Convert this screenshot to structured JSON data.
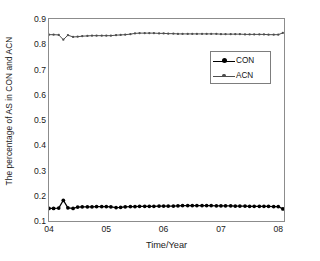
{
  "chart_data": {
    "type": "line",
    "title": "",
    "xlabel": "Time/Year",
    "ylabel": "The percentage of AS in CON and ACN",
    "xlim": [
      2004.0,
      2008.1
    ],
    "ylim": [
      0.1,
      0.9
    ],
    "xticks": [
      "04",
      "05",
      "06",
      "07",
      "08"
    ],
    "xtick_values": [
      2004,
      2005,
      2006,
      2007,
      2008
    ],
    "yticks": [
      "0.1",
      "0.2",
      "0.3",
      "0.4",
      "0.5",
      "0.6",
      "0.7",
      "0.8",
      "0.9"
    ],
    "ytick_values": [
      0.1,
      0.2,
      0.3,
      0.4,
      0.5,
      0.6,
      0.7,
      0.8,
      0.9
    ],
    "grid": false,
    "legend_position": "upper-right",
    "series": [
      {
        "name": "CON",
        "color": "#000000",
        "marker": "filled-circle",
        "x": [
          2004.0,
          2004.08,
          2004.17,
          2004.25,
          2004.33,
          2004.42,
          2004.5,
          2004.58,
          2004.67,
          2004.75,
          2004.83,
          2004.92,
          2005.0,
          2005.08,
          2005.17,
          2005.25,
          2005.33,
          2005.42,
          2005.5,
          2005.58,
          2005.67,
          2005.75,
          2005.83,
          2005.92,
          2006.0,
          2006.08,
          2006.17,
          2006.25,
          2006.33,
          2006.42,
          2006.5,
          2006.58,
          2006.67,
          2006.75,
          2006.83,
          2006.92,
          2007.0,
          2007.08,
          2007.17,
          2007.25,
          2007.33,
          2007.42,
          2007.5,
          2007.58,
          2007.67,
          2007.75,
          2007.83,
          2007.92,
          2008.0,
          2008.08
        ],
        "values": [
          0.15,
          0.15,
          0.151,
          0.182,
          0.152,
          0.15,
          0.155,
          0.156,
          0.156,
          0.156,
          0.157,
          0.157,
          0.157,
          0.156,
          0.153,
          0.154,
          0.156,
          0.157,
          0.157,
          0.158,
          0.158,
          0.158,
          0.158,
          0.159,
          0.159,
          0.159,
          0.159,
          0.16,
          0.161,
          0.161,
          0.161,
          0.161,
          0.161,
          0.161,
          0.161,
          0.16,
          0.16,
          0.16,
          0.16,
          0.159,
          0.159,
          0.159,
          0.158,
          0.158,
          0.158,
          0.158,
          0.158,
          0.157,
          0.157,
          0.148
        ]
      },
      {
        "name": "ACN",
        "color": "#4d4d4d",
        "marker": "small-dash",
        "x": [
          2004.0,
          2004.08,
          2004.17,
          2004.25,
          2004.33,
          2004.42,
          2004.5,
          2004.58,
          2004.67,
          2004.75,
          2004.83,
          2004.92,
          2005.0,
          2005.08,
          2005.17,
          2005.25,
          2005.33,
          2005.42,
          2005.5,
          2005.58,
          2005.67,
          2005.75,
          2005.83,
          2005.92,
          2006.0,
          2006.08,
          2006.17,
          2006.25,
          2006.33,
          2006.42,
          2006.5,
          2006.58,
          2006.67,
          2006.75,
          2006.83,
          2006.92,
          2007.0,
          2007.08,
          2007.17,
          2007.25,
          2007.33,
          2007.42,
          2007.5,
          2007.58,
          2007.67,
          2007.75,
          2007.83,
          2007.92,
          2008.0,
          2008.08
        ],
        "values": [
          0.838,
          0.838,
          0.837,
          0.818,
          0.836,
          0.829,
          0.83,
          0.832,
          0.833,
          0.834,
          0.834,
          0.834,
          0.834,
          0.834,
          0.836,
          0.837,
          0.838,
          0.84,
          0.843,
          0.844,
          0.844,
          0.844,
          0.844,
          0.843,
          0.843,
          0.842,
          0.842,
          0.841,
          0.841,
          0.841,
          0.841,
          0.841,
          0.841,
          0.841,
          0.841,
          0.841,
          0.84,
          0.84,
          0.84,
          0.84,
          0.84,
          0.839,
          0.839,
          0.839,
          0.839,
          0.839,
          0.838,
          0.838,
          0.838,
          0.845
        ]
      }
    ]
  },
  "legend": {
    "items": [
      {
        "label": "CON"
      },
      {
        "label": "ACN"
      }
    ]
  },
  "axes": {
    "x_title": "Time/Year",
    "y_title": "The percentage of AS in CON and ACN"
  }
}
